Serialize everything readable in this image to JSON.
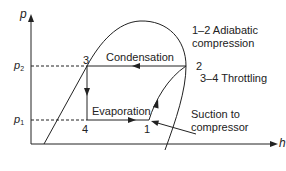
{
  "diagram": {
    "type": "p-h diagram (vapour compression refrigeration cycle)",
    "axes": {
      "y_label": "p",
      "x_label": "h",
      "p2_label": "p",
      "p2_sub": "2",
      "p1_label": "p",
      "p1_sub": "1"
    },
    "points": {
      "p1": "1",
      "p2": "2",
      "p3": "3",
      "p4": "4"
    },
    "processes": {
      "condensation": "Condensation",
      "evaporation": "Evaporation",
      "compression": "1–2 Adiabatic",
      "compression_line2": "compression",
      "throttling": "3–4 Throttling",
      "suction": "Suction to",
      "suction_line2": "compressor"
    },
    "colors": {
      "line": "#222222",
      "background": "#ffffff"
    }
  }
}
